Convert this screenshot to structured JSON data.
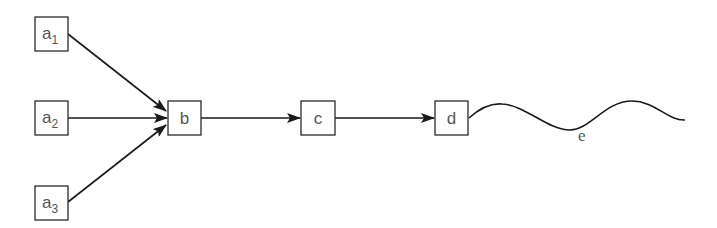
{
  "diagram": {
    "type": "directed-graph",
    "colors": {
      "stroke": "#1a1a1a",
      "box_border": "#2a2a2a",
      "label": "#555555",
      "background": "#ffffff"
    },
    "nodes": [
      {
        "id": "a1",
        "base": "a",
        "subscript": "1"
      },
      {
        "id": "a2",
        "base": "a",
        "subscript": "2"
      },
      {
        "id": "a3",
        "base": "a",
        "subscript": "3"
      },
      {
        "id": "b",
        "base": "b",
        "subscript": ""
      },
      {
        "id": "c",
        "base": "c",
        "subscript": ""
      },
      {
        "id": "d",
        "base": "d",
        "subscript": ""
      }
    ],
    "edges": [
      {
        "from": "a1",
        "to": "b"
      },
      {
        "from": "a2",
        "to": "b"
      },
      {
        "from": "a3",
        "to": "b"
      },
      {
        "from": "b",
        "to": "c"
      },
      {
        "from": "c",
        "to": "d"
      }
    ],
    "wave": {
      "from": "d",
      "label": "e"
    }
  }
}
